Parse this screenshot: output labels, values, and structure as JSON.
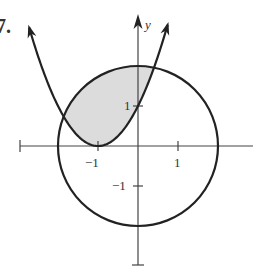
{
  "problem": {
    "number": "7."
  },
  "axes": {
    "x_label": "x",
    "y_label": "y",
    "x_ticks": [
      {
        "value": -1,
        "label": "−1"
      },
      {
        "value": 1,
        "label": "1"
      }
    ],
    "y_ticks": [
      {
        "value": 1,
        "label": "1"
      },
      {
        "value": -1,
        "label": "−1"
      }
    ],
    "x_range": [
      -3,
      3
    ],
    "y_range": [
      -3,
      3
    ]
  },
  "curves": [
    {
      "name": "parabola",
      "equation": "y = (x + 1)^2",
      "vertex": [
        -1,
        0
      ]
    },
    {
      "name": "circle",
      "equation": "x^2 + y^2 = 4",
      "center": [
        0,
        0
      ],
      "radius": 2
    }
  ],
  "shaded_region": {
    "description": "Region inside the circle and above the parabola",
    "color": "#dcdcdc"
  },
  "colors": {
    "curve": "#222222",
    "axis": "#444444",
    "shade": "#dcdcdc"
  }
}
